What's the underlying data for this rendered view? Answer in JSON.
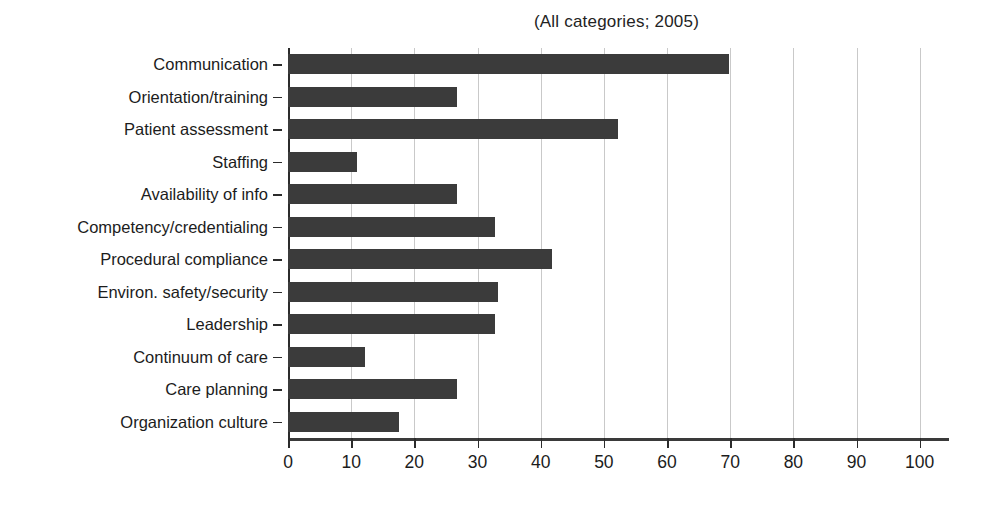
{
  "chart_data": {
    "type": "bar",
    "orientation": "horizontal",
    "title": "(All categories; 2005)",
    "subtitle": "",
    "xlabel": "",
    "ylabel": "",
    "xlim": [
      0,
      104
    ],
    "ylim": null,
    "grid": true,
    "grid_axis": "x",
    "legend": null,
    "legend_position": "none",
    "categories": [
      "Communication",
      "Orientation/training",
      "Patient assessment",
      "Staffing",
      "Availability of info",
      "Competency/credentialing",
      "Procedural compliance",
      "Environ. safety/security",
      "Leadership",
      "Continuum of care",
      "Care planning",
      "Organization culture"
    ],
    "values": [
      69.8,
      26.8,
      52.3,
      11,
      26.8,
      32.8,
      41.8,
      33.2,
      32.8,
      12.2,
      26.8,
      17.5
    ],
    "xticks": [
      0,
      10,
      20,
      30,
      40,
      50,
      60,
      70,
      80,
      90,
      100
    ],
    "xticklabels": [
      "0",
      "10",
      "20",
      "30",
      "40",
      "50",
      "60",
      "70",
      "80",
      "90",
      "100"
    ],
    "bar_color": "#3b3b3b",
    "grid_color": "#c9c9c9",
    "axis_color": "#2b2b2b"
  }
}
